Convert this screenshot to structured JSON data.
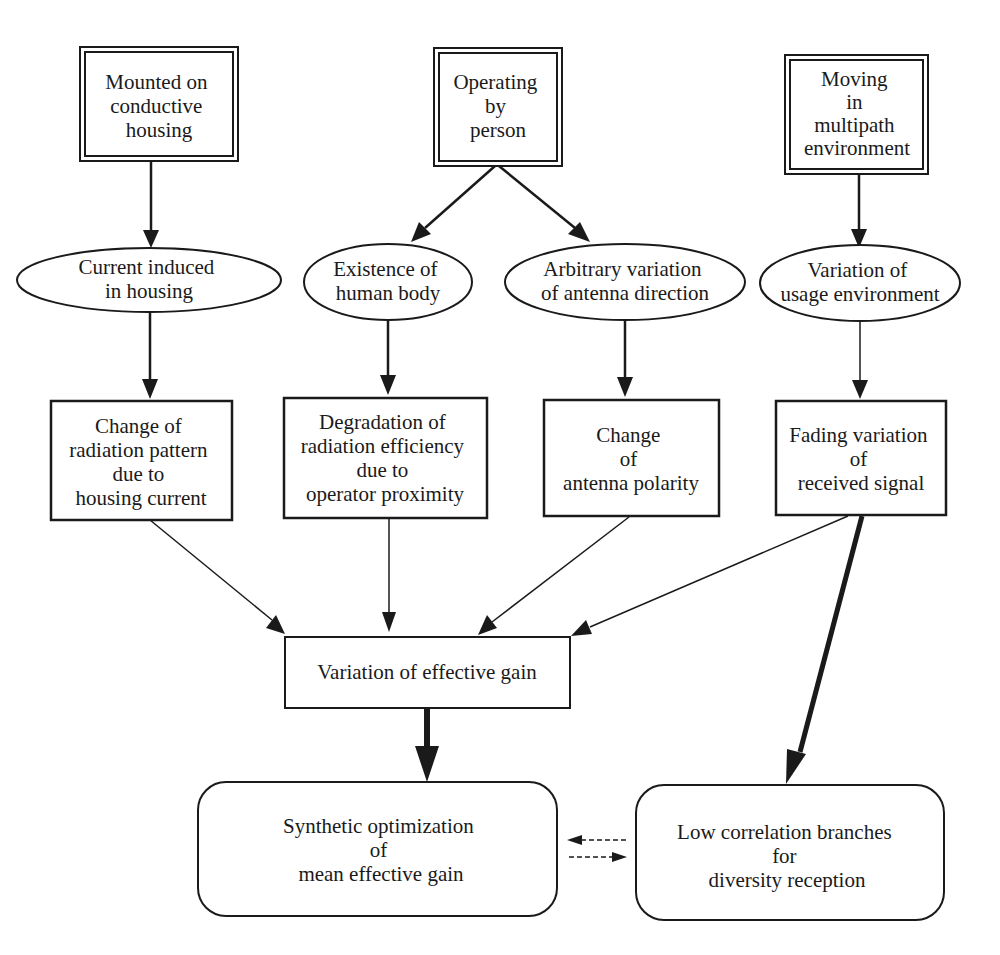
{
  "diagram": {
    "colors": {
      "line": "#1a1a1a",
      "background": "#ffffff"
    },
    "sources": [
      {
        "id": "s1",
        "lines": [
          "Mounted on",
          "conductive",
          "housing"
        ],
        "shape": "double-rect"
      },
      {
        "id": "s2",
        "lines": [
          "Operating",
          "by",
          "person"
        ],
        "shape": "double-rect"
      },
      {
        "id": "s3",
        "lines": [
          "Moving",
          "in",
          "multipath",
          "environment"
        ],
        "shape": "double-rect"
      }
    ],
    "causes": [
      {
        "id": "c1",
        "lines": [
          "Current induced",
          "in housing"
        ],
        "shape": "ellipse"
      },
      {
        "id": "c2",
        "lines": [
          "Existence of",
          "human body"
        ],
        "shape": "ellipse"
      },
      {
        "id": "c3",
        "lines": [
          "Arbitrary variation",
          "of antenna direction"
        ],
        "shape": "ellipse"
      },
      {
        "id": "c4",
        "lines": [
          "Variation of",
          "usage environment"
        ],
        "shape": "ellipse"
      }
    ],
    "effects": [
      {
        "id": "e1",
        "lines": [
          "Change of",
          "radiation pattern",
          "due to",
          "housing current"
        ],
        "shape": "rect"
      },
      {
        "id": "e2",
        "lines": [
          "Degradation of",
          "radiation efficiency",
          "due to",
          "operator proximity"
        ],
        "shape": "rect"
      },
      {
        "id": "e3",
        "lines": [
          "Change",
          "of",
          "antenna polarity"
        ],
        "shape": "rect"
      },
      {
        "id": "e4",
        "lines": [
          "Fading variation",
          "of",
          "received signal"
        ],
        "shape": "rect"
      }
    ],
    "center": {
      "id": "g1",
      "lines": [
        "Variation of effective gain"
      ],
      "shape": "rect"
    },
    "outcomes": [
      {
        "id": "o1",
        "lines": [
          "Synthetic optimization",
          "of",
          "mean effective gain"
        ],
        "shape": "rounded-rect"
      },
      {
        "id": "o2",
        "lines": [
          "Low correlation branches",
          "for",
          "diversity reception"
        ],
        "shape": "rounded-rect"
      }
    ],
    "edges": [
      {
        "from": "s1",
        "to": "c1",
        "style": "medium"
      },
      {
        "from": "s2",
        "to": "c2",
        "style": "medium"
      },
      {
        "from": "s2",
        "to": "c3",
        "style": "medium"
      },
      {
        "from": "s3",
        "to": "c4",
        "style": "medium"
      },
      {
        "from": "c1",
        "to": "e1",
        "style": "medium"
      },
      {
        "from": "c2",
        "to": "e2",
        "style": "medium"
      },
      {
        "from": "c3",
        "to": "e3",
        "style": "medium"
      },
      {
        "from": "c4",
        "to": "e4",
        "style": "thin"
      },
      {
        "from": "e1",
        "to": "g1",
        "style": "thin"
      },
      {
        "from": "e2",
        "to": "g1",
        "style": "thin"
      },
      {
        "from": "e3",
        "to": "g1",
        "style": "thin"
      },
      {
        "from": "e4",
        "to": "g1",
        "style": "thin"
      },
      {
        "from": "g1",
        "to": "o1",
        "style": "thick"
      },
      {
        "from": "e4",
        "to": "o2",
        "style": "thick"
      },
      {
        "from": "o2",
        "to": "o1",
        "style": "dashed"
      },
      {
        "from": "o1",
        "to": "o2",
        "style": "dashed"
      }
    ]
  }
}
